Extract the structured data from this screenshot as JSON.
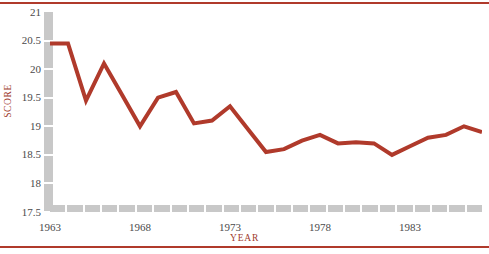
{
  "chart_data": {
    "type": "line",
    "title": "",
    "subtitle": "",
    "xlabel": "YEAR",
    "ylabel": "SCORE",
    "xlim": [
      1963,
      1987
    ],
    "ylim": [
      17.5,
      21
    ],
    "ytick_labels": [
      "21",
      "20.5",
      "20",
      "19.5",
      "19",
      "18.5",
      "18",
      "17.5"
    ],
    "ytick_values": [
      21,
      20.5,
      20,
      19.5,
      19,
      18.5,
      18,
      17.5
    ],
    "xtick_labels": [
      "1963",
      "1968",
      "1973",
      "1978",
      "1983"
    ],
    "xtick_values": [
      1963,
      1968,
      1973,
      1978,
      1983
    ],
    "grid": false,
    "legend": "none",
    "line_color": "#b03a2b",
    "axis_color": "#c8c8c8",
    "x": [
      1963,
      1964,
      1965,
      1966,
      1967,
      1968,
      1969,
      1970,
      1971,
      1972,
      1973,
      1974,
      1975,
      1976,
      1977,
      1978,
      1979,
      1980,
      1981,
      1982,
      1983,
      1984,
      1985,
      1986,
      1987
    ],
    "values": [
      20.45,
      20.45,
      19.45,
      20.1,
      19.55,
      19.0,
      19.5,
      19.6,
      19.05,
      19.1,
      19.35,
      18.95,
      18.55,
      18.6,
      18.75,
      18.85,
      18.7,
      18.72,
      18.7,
      18.5,
      18.65,
      18.8,
      18.85,
      19.0,
      18.9
    ],
    "series": [
      {
        "name": "SCORE",
        "color": "#b03a2b",
        "values": [
          20.45,
          20.45,
          19.45,
          20.1,
          19.55,
          19.0,
          19.5,
          19.6,
          19.05,
          19.1,
          19.35,
          18.95,
          18.55,
          18.6,
          18.75,
          18.85,
          18.7,
          18.72,
          18.7,
          18.5,
          18.65,
          18.8,
          18.85,
          19.0,
          18.9
        ]
      }
    ]
  },
  "figure": {
    "border_color": "#b03a2b"
  }
}
